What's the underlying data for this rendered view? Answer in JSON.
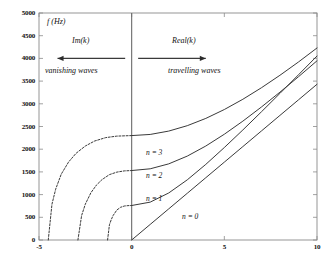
{
  "figure": {
    "background": "#ffffff",
    "frame_color": "#8a8a8a",
    "curve_color": "#3a3a3a"
  },
  "annotations": {
    "y_axis_title": "f (Hz)",
    "imag_label": "Im(k)",
    "real_label": "Real(k)",
    "left_region": "vanishing waves",
    "right_region": "travelling waves"
  },
  "curve_labels": [
    {
      "text": "n = 3",
      "x": 146,
      "y": 148
    },
    {
      "text": "n = 2",
      "x": 146,
      "y": 171
    },
    {
      "text": "n = 1",
      "x": 146,
      "y": 194
    },
    {
      "text": "n = 0",
      "x": 182,
      "y": 212
    }
  ],
  "chart_data": {
    "type": "line",
    "title": "",
    "xlabel": "",
    "ylabel": "f (Hz)",
    "xlim": [
      -5,
      10
    ],
    "ylim": [
      0,
      5000
    ],
    "xticks": [
      -5,
      0,
      5,
      10
    ],
    "xtick_labels": [
      "-5",
      "0",
      "5",
      "10"
    ],
    "yticks": [
      0,
      500,
      1000,
      1500,
      2000,
      2500,
      3000,
      3500,
      4000,
      4500,
      5000
    ],
    "ytick_labels": [
      "0",
      "500",
      "1000",
      "1500",
      "2000",
      "2500",
      "3000",
      "3500",
      "4000",
      "4500",
      "5000"
    ],
    "grid": false,
    "legend": "inline-curve-labels",
    "cutoff_frequencies": [
      0,
      760,
      1530,
      2300
    ],
    "sound_speed": 343,
    "series": [
      {
        "name": "n = 0",
        "mode": 0,
        "cutoff": 0,
        "style": "solid",
        "branch": "travelling",
        "points": [
          [
            0,
            0
          ],
          [
            1,
            343
          ],
          [
            2,
            686
          ],
          [
            3,
            1029
          ],
          [
            4,
            1372
          ],
          [
            5,
            1715
          ],
          [
            6,
            2058
          ],
          [
            7,
            2401
          ],
          [
            8,
            2744
          ],
          [
            9,
            3087
          ],
          [
            10,
            3430
          ]
        ]
      },
      {
        "name": "n = 1",
        "mode": 1,
        "cutoff": 760,
        "style": "solid",
        "branch": "travelling",
        "points": [
          [
            0,
            760
          ],
          [
            1,
            834
          ],
          [
            2,
            1036
          ],
          [
            3,
            1325
          ],
          [
            4,
            1666
          ],
          [
            5,
            2037
          ],
          [
            6,
            2424
          ],
          [
            7,
            2823
          ],
          [
            8,
            3229
          ],
          [
            9,
            3639
          ],
          [
            10,
            4052
          ]
        ]
      },
      {
        "name": "n = 2",
        "mode": 2,
        "cutoff": 1530,
        "style": "solid",
        "branch": "travelling",
        "points": [
          [
            0,
            1530
          ],
          [
            1,
            1568
          ],
          [
            2,
            1677
          ],
          [
            3,
            1848
          ],
          [
            4,
            2070
          ],
          [
            5,
            2330
          ],
          [
            6,
            2618
          ],
          [
            7,
            2929
          ],
          [
            8,
            3256
          ],
          [
            9,
            3596
          ],
          [
            10,
            3947
          ]
        ]
      },
      {
        "name": "n = 3",
        "mode": 3,
        "cutoff": 2300,
        "style": "solid",
        "branch": "travelling",
        "points": [
          [
            0,
            2300
          ],
          [
            1,
            2325
          ],
          [
            2,
            2399
          ],
          [
            3,
            2518
          ],
          [
            4,
            2678
          ],
          [
            5,
            2874
          ],
          [
            6,
            3100
          ],
          [
            7,
            3353
          ],
          [
            8,
            3628
          ],
          [
            9,
            3921
          ],
          [
            10,
            4230
          ]
        ]
      },
      {
        "name": "n = 1 (evanescent)",
        "mode": 1,
        "cutoff": 760,
        "style": "dashed",
        "branch": "vanishing",
        "points": [
          [
            -1.3,
            0
          ],
          [
            -1.2,
            335
          ],
          [
            -1.1,
            450
          ],
          [
            -1.0,
            540
          ],
          [
            -0.8,
            660
          ],
          [
            -0.6,
            720
          ],
          [
            -0.4,
            748
          ],
          [
            -0.2,
            757
          ],
          [
            0,
            760
          ]
        ]
      },
      {
        "name": "n = 2 (evanescent)",
        "mode": 2,
        "cutoff": 1530,
        "style": "dashed",
        "branch": "vanishing",
        "points": [
          [
            -2.9,
            0
          ],
          [
            -2.7,
            540
          ],
          [
            -2.5,
            790
          ],
          [
            -2.2,
            1040
          ],
          [
            -1.9,
            1210
          ],
          [
            -1.6,
            1330
          ],
          [
            -1.2,
            1440
          ],
          [
            -0.8,
            1495
          ],
          [
            -0.4,
            1522
          ],
          [
            0,
            1530
          ]
        ]
      },
      {
        "name": "n = 3 (evanescent)",
        "mode": 3,
        "cutoff": 2300,
        "style": "dashed",
        "branch": "vanishing",
        "points": [
          [
            -4.5,
            0
          ],
          [
            -4.3,
            790
          ],
          [
            -4.1,
            1120
          ],
          [
            -3.8,
            1450
          ],
          [
            -3.4,
            1720
          ],
          [
            -3.0,
            1910
          ],
          [
            -2.5,
            2070
          ],
          [
            -2.0,
            2180
          ],
          [
            -1.4,
            2255
          ],
          [
            -0.8,
            2288
          ],
          [
            0,
            2300
          ]
        ]
      }
    ]
  }
}
